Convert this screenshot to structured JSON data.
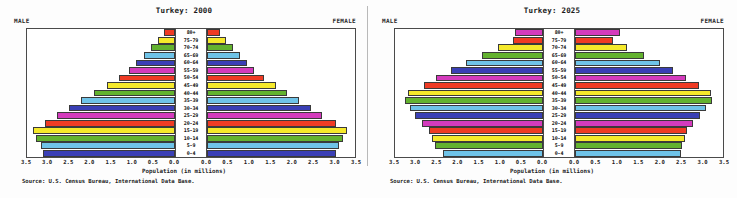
{
  "figure": {
    "source_note": "Source: U.S. Census Bureau, International Data Base.",
    "xaxis_title": "Population (in millions)",
    "male_label": "MALE",
    "female_label": "FEMALE",
    "tick_labels_left": [
      "3.5",
      "3.0",
      "2.5",
      "2.0",
      "1.5",
      "1.0",
      "0.5",
      "0.0"
    ],
    "tick_labels_right": [
      "0.0",
      "0.5",
      "1.0",
      "1.5",
      "2.0",
      "2.5",
      "3.0",
      "3.5"
    ],
    "axis_max": 3.5,
    "palette": {
      "red": "#ef3b24",
      "yellow": "#f5e92b",
      "green": "#63b22f",
      "lightblue": "#6fc3e8",
      "darkblue": "#3a3fb5",
      "magenta": "#d43bbd"
    }
  },
  "chart_data": [
    {
      "type": "bar",
      "title": "Turkey: 2000",
      "subtype": "population-pyramid",
      "xlabel": "Population (in millions)",
      "ylabel": "",
      "xlim": [
        0,
        3.5
      ],
      "grid": false,
      "legend": "none",
      "categories": [
        "80+",
        "75-79",
        "70-74",
        "65-69",
        "60-64",
        "55-59",
        "50-54",
        "45-49",
        "40-44",
        "35-39",
        "30-34",
        "25-29",
        "20-24",
        "15-19",
        "10-14",
        "5-9",
        "0-4"
      ],
      "colors": [
        "#ef3b24",
        "#f5e92b",
        "#63b22f",
        "#6fc3e8",
        "#3a3fb5",
        "#d43bbd",
        "#ef3b24",
        "#f5e92b",
        "#63b22f",
        "#6fc3e8",
        "#3a3fb5",
        "#d43bbd",
        "#ef3b24",
        "#f5e92b",
        "#63b22f",
        "#6fc3e8",
        "#3a3fb5"
      ],
      "series": [
        {
          "name": "MALE",
          "side": "left",
          "values": [
            0.26,
            0.4,
            0.56,
            0.74,
            0.92,
            1.1,
            1.33,
            1.62,
            1.92,
            2.22,
            2.5,
            2.78,
            3.08,
            3.35,
            3.28,
            3.18,
            3.12
          ]
        },
        {
          "name": "FEMALE",
          "side": "right",
          "values": [
            0.3,
            0.44,
            0.62,
            0.78,
            0.94,
            1.12,
            1.35,
            1.62,
            1.9,
            2.18,
            2.45,
            2.72,
            3.05,
            3.3,
            3.22,
            3.12,
            3.05
          ]
        }
      ]
    },
    {
      "type": "bar",
      "title": "Turkey: 2025",
      "subtype": "population-pyramid",
      "xlabel": "Population (in millions)",
      "ylabel": "",
      "xlim": [
        0,
        3.5
      ],
      "grid": false,
      "legend": "none",
      "categories": [
        "80+",
        "75-79",
        "70-74",
        "65-69",
        "60-64",
        "55-59",
        "50-54",
        "45-49",
        "40-44",
        "35-39",
        "30-34",
        "25-29",
        "20-24",
        "15-19",
        "10-14",
        "5-9",
        "0-4"
      ],
      "colors": [
        "#d43bbd",
        "#ef3b24",
        "#f5e92b",
        "#63b22f",
        "#6fc3e8",
        "#3a3fb5",
        "#d43bbd",
        "#ef3b24",
        "#f5e92b",
        "#63b22f",
        "#6fc3e8",
        "#3a3fb5",
        "#d43bbd",
        "#ef3b24",
        "#f5e92b",
        "#63b22f",
        "#6fc3e8"
      ],
      "series": [
        {
          "name": "MALE",
          "side": "left",
          "values": [
            0.66,
            0.7,
            1.06,
            1.44,
            1.82,
            2.18,
            2.52,
            2.82,
            3.2,
            3.26,
            3.14,
            3.02,
            2.86,
            2.7,
            2.62,
            2.56,
            2.36
          ]
        },
        {
          "name": "FEMALE",
          "side": "right",
          "values": [
            1.06,
            0.9,
            1.22,
            1.64,
            2.02,
            2.32,
            2.62,
            2.94,
            3.22,
            3.24,
            3.1,
            2.96,
            2.8,
            2.66,
            2.6,
            2.54,
            2.5
          ]
        }
      ]
    }
  ]
}
